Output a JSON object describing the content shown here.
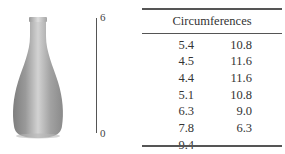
{
  "figure": {
    "object": "vase",
    "scale": {
      "top_label": "6",
      "bottom_label": "0"
    }
  },
  "table": {
    "header": "Circumferences",
    "rows": [
      [
        "5.4",
        "10.8"
      ],
      [
        "4.5",
        "11.6"
      ],
      [
        "4.4",
        "11.6"
      ],
      [
        "5.1",
        "10.8"
      ],
      [
        "6.3",
        "9.0"
      ],
      [
        "7.8",
        "6.3"
      ],
      [
        "9.4",
        ""
      ]
    ]
  },
  "colors": {
    "vase_light": "#c8c8c8",
    "vase_dark": "#7a7a7a",
    "rule": "#555555"
  }
}
